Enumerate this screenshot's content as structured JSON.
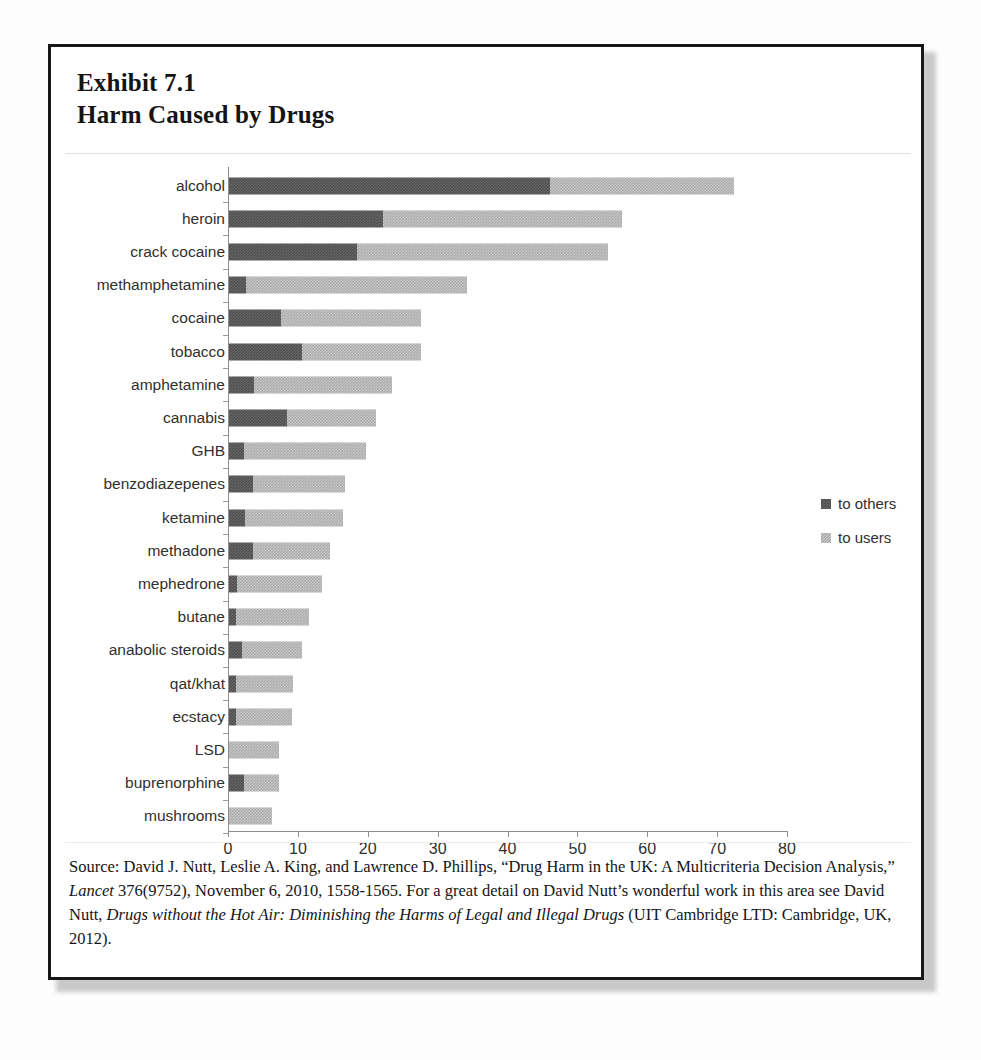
{
  "exhibit": {
    "number_line": "Exhibit 7.1",
    "title_line": "Harm Caused by Drugs",
    "source_note": "Source: David J. Nutt, Leslie A. King, and Lawrence D. Phillips, “Drug Harm in the UK: A Multicriteria Decision Analysis,” Lancet 376(9752), November 6, 2010, 1558-1565.  For a great detail on David Nutt’s wonderful work in this area see David Nutt, Drugs without the Hot Air: Diminishing the Harms of Legal and Illegal Drugs (UIT Cambridge LTD: Cambridge, UK, 2012).",
    "source_segments": [
      {
        "text": "Source: David J. Nutt, Leslie A. King, and Lawrence D. Phillips, “Drug Harm in the UK: A Multicriteria Decision Analysis,” ",
        "italic": false
      },
      {
        "text": "Lancet",
        "italic": true
      },
      {
        "text": " 376(9752), November 6, 2010, 1558-1565.  For a great detail on David Nutt’s wonderful work in this area see David Nutt, ",
        "italic": false
      },
      {
        "text": "Drugs without the Hot Air: Diminishing the Harms of Legal and Illegal Drugs",
        "italic": true
      },
      {
        "text": " (UIT Cambridge LTD: Cambridge, UK, 2012).",
        "italic": false
      }
    ]
  },
  "colors": {
    "to_others": "#4e4e4e",
    "to_users": "#aaaaaa",
    "frame": "#171717",
    "axis": "#8d8d8d",
    "text": "#2f2f2f"
  },
  "chart_data": {
    "type": "bar",
    "orientation": "horizontal",
    "stacked": true,
    "title": "Harm Caused by Drugs",
    "xlabel": "",
    "ylabel": "",
    "xlim": [
      0,
      80
    ],
    "xticks": [
      0,
      10,
      20,
      30,
      40,
      50,
      60,
      70,
      80
    ],
    "xtick_labels": [
      "0",
      "10",
      "20",
      "30",
      "40",
      "50",
      "60",
      "70",
      "80"
    ],
    "grid": false,
    "legend_position": "right",
    "categories": [
      "alcohol",
      "heroin",
      "crack cocaine",
      "methamphetamine",
      "cocaine",
      "tobacco",
      "amphetamine",
      "cannabis",
      "GHB",
      "benzodiazepenes",
      "ketamine",
      "methadone",
      "mephedrone",
      "butane",
      "anabolic steroids",
      "qat/khat",
      "ecstacy",
      "LSD",
      "buprenorphine",
      "mushrooms"
    ],
    "series": [
      {
        "name": "to others",
        "color": "#4e4e4e",
        "values": [
          46.0,
          22.0,
          18.3,
          2.4,
          7.4,
          10.5,
          3.6,
          8.3,
          2.2,
          3.4,
          2.3,
          3.4,
          1.1,
          1.0,
          1.9,
          1.0,
          1.0,
          0.0,
          2.1,
          0.0
        ]
      },
      {
        "name": "to users",
        "color": "#aaaaaa",
        "values": [
          26.3,
          34.3,
          36.0,
          31.7,
          20.1,
          17.0,
          19.7,
          12.7,
          17.4,
          13.2,
          14.0,
          11.1,
          12.2,
          10.4,
          8.6,
          8.2,
          8.0,
          7.2,
          5.0,
          6.2
        ]
      }
    ],
    "totals": [
      72.3,
      56.3,
      54.3,
      34.1,
      27.5,
      27.5,
      23.3,
      21.0,
      19.6,
      16.6,
      16.3,
      14.5,
      13.3,
      11.4,
      10.5,
      9.2,
      9.0,
      7.2,
      7.1,
      6.2
    ],
    "legend": [
      "to others",
      "to users"
    ]
  }
}
